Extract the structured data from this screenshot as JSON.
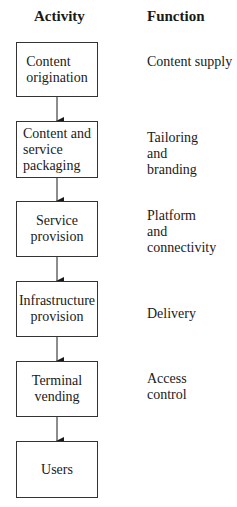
{
  "headers": {
    "activity": "Activity",
    "function": "Function"
  },
  "rows": [
    {
      "activity": "Content\norigination",
      "function": "Content supply"
    },
    {
      "activity": "Content and\nservice\npackaging",
      "function": "Tailoring\nand\nbranding"
    },
    {
      "activity": "Service\nprovision",
      "function": "Platform\nand\nconnectivity"
    },
    {
      "activity": "Infrastructure\nprovision",
      "function": "Delivery"
    },
    {
      "activity": "Terminal\nvending",
      "function": "Access\ncontrol"
    },
    {
      "activity": "Users",
      "function": ""
    }
  ]
}
